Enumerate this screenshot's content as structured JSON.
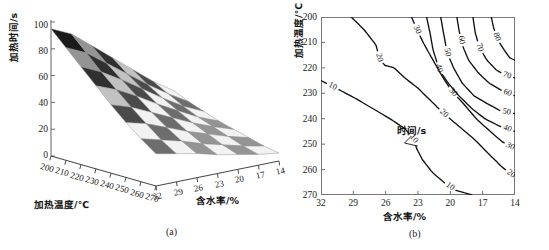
{
  "figure": {
    "panels": [
      {
        "id": "a",
        "caption": "(a)",
        "type": "surface3d",
        "xlabel": "加热温度/℃",
        "ylabel": "含水率/%",
        "zlabel": "加热时间/s",
        "xticks": [
          "200",
          "210",
          "220",
          "230",
          "240",
          "250",
          "260",
          "270"
        ],
        "yticks": [
          "32",
          "29",
          "26",
          "23",
          "20",
          "17",
          "14"
        ],
        "zticks": [
          "0",
          "20",
          "40",
          "60",
          "80",
          "100"
        ]
      },
      {
        "id": "b",
        "caption": "(b)",
        "type": "contour",
        "xlabel": "含水率/%",
        "ylabel": "加热温度/℃",
        "xticks": [
          "32",
          "29",
          "26",
          "23",
          "20",
          "17",
          "14"
        ],
        "yticks": [
          "200",
          "210",
          "220",
          "230",
          "240",
          "250",
          "260",
          "270"
        ],
        "annotation": "时间/s",
        "contour_levels": [
          "10",
          "20",
          "30",
          "40",
          "50",
          "60",
          "70",
          "80"
        ]
      }
    ]
  },
  "chart_data": [
    {
      "type": "area",
      "subtype": "surface3d-mesh",
      "title": "",
      "panel": "(a)",
      "xlabel": "加热温度/℃",
      "ylabel": "含水率/%",
      "zlabel": "加热时间/s",
      "xlim": [
        200,
        270
      ],
      "ylim": [
        32,
        14
      ],
      "zlim": [
        0,
        100
      ],
      "grid": false,
      "legend": "none",
      "x": [
        200,
        210,
        220,
        230,
        240,
        250,
        260,
        270
      ],
      "y": [
        32,
        29,
        26,
        23,
        20,
        17,
        14
      ],
      "z_note": "heating time (s) as function of heating temperature (x) and moisture content (y); falls with rising temperature and with falling moisture content",
      "z": [
        [
          95,
          88,
          76,
          64,
          52,
          40,
          30
        ],
        [
          84,
          77,
          66,
          55,
          44,
          34,
          25
        ],
        [
          73,
          66,
          57,
          47,
          37,
          28,
          21
        ],
        [
          62,
          56,
          48,
          39,
          31,
          23,
          17
        ],
        [
          51,
          46,
          39,
          32,
          25,
          19,
          14
        ],
        [
          41,
          37,
          31,
          25,
          20,
          15,
          11
        ],
        [
          32,
          28,
          24,
          19,
          15,
          11,
          8
        ],
        [
          24,
          21,
          18,
          14,
          11,
          8,
          6
        ]
      ]
    },
    {
      "type": "line",
      "subtype": "contour",
      "title": "",
      "panel": "(b)",
      "xlabel": "含水率/%",
      "ylabel": "加热温度/℃",
      "xlim": [
        32,
        14
      ],
      "ylim": [
        200,
        270
      ],
      "yaxis_inverted": true,
      "grid": false,
      "legend": "none",
      "annotations": [
        {
          "text": "时间/s",
          "x": 23.6,
          "y": 246,
          "points_to_contour": "10"
        }
      ],
      "levels": [
        10,
        20,
        30,
        40,
        50,
        60,
        70,
        80
      ],
      "contours": [
        {
          "level": "10",
          "label_positions": [
            {
              "x": 31.0,
              "y": 228
            },
            {
              "x": 23.4,
              "y": 248
            },
            {
              "x": 20.4,
              "y": 269
            }
          ],
          "path": [
            [
              32,
              225
            ],
            [
              30.6,
              228
            ],
            [
              28.8,
              232
            ],
            [
              27.2,
              236
            ],
            [
              25.6,
              240
            ],
            [
              24.2,
              244
            ],
            [
              23.4,
              248
            ],
            [
              23.1,
              252
            ],
            [
              22.6,
              256
            ],
            [
              21.7,
              261
            ],
            [
              20.6,
              265
            ],
            [
              19.6,
              268
            ],
            [
              18.0,
              270
            ]
          ]
        },
        {
          "level": "20",
          "label_positions": [
            {
              "x": 26.6,
              "y": 216
            },
            {
              "x": 20.6,
              "y": 238
            },
            {
              "x": 14.6,
              "y": 263
            }
          ],
          "path": [
            [
              29.2,
              200
            ],
            [
              28.0,
              205
            ],
            [
              26.9,
              211
            ],
            [
              26.6,
              216
            ],
            [
              26.1,
              219
            ],
            [
              25.2,
              220
            ],
            [
              24.2,
              224
            ],
            [
              23.0,
              228
            ],
            [
              21.8,
              233
            ],
            [
              20.6,
              238
            ],
            [
              19.2,
              243
            ],
            [
              17.8,
              248
            ],
            [
              16.4,
              254
            ],
            [
              15.2,
              259
            ],
            [
              14,
              263
            ]
          ]
        },
        {
          "level": "30",
          "label_positions": [
            {
              "x": 23.1,
              "y": 205
            },
            {
              "x": 19.6,
              "y": 229
            },
            {
              "x": 14.6,
              "y": 252
            }
          ],
          "path": [
            [
              23.6,
              200
            ],
            [
              23.1,
              205
            ],
            [
              22.4,
              211
            ],
            [
              21.6,
              217
            ],
            [
              20.8,
              223
            ],
            [
              19.9,
              229
            ],
            [
              18.8,
              234
            ],
            [
              17.6,
              240
            ],
            [
              16.3,
              245
            ],
            [
              15.2,
              249
            ],
            [
              14,
              252
            ]
          ]
        },
        {
          "level": "40",
          "label_positions": [
            {
              "x": 21.6,
              "y": 221
            },
            {
              "x": 14.8,
              "y": 245
            }
          ],
          "path": [
            [
              22.2,
              200
            ],
            [
              21.9,
              206
            ],
            [
              21.6,
              213
            ],
            [
              21.0,
              221
            ],
            [
              20.2,
              226
            ],
            [
              19.2,
              231
            ],
            [
              18.0,
              236
            ],
            [
              16.8,
              240
            ],
            [
              15.4,
              243
            ],
            [
              14,
              245
            ]
          ]
        },
        {
          "level": "50",
          "label_positions": [
            {
              "x": 20.4,
              "y": 214
            },
            {
              "x": 14.8,
              "y": 238
            }
          ],
          "path": [
            [
              20.9,
              200
            ],
            [
              20.6,
              207
            ],
            [
              20.3,
              214
            ],
            [
              19.7,
              220
            ],
            [
              18.9,
              226
            ],
            [
              17.8,
              231
            ],
            [
              16.6,
              234
            ],
            [
              15.3,
              237
            ],
            [
              14,
              238
            ]
          ]
        },
        {
          "level": "60",
          "label_positions": [
            {
              "x": 18.9,
              "y": 209
            },
            {
              "x": 14.8,
              "y": 231
            }
          ],
          "path": [
            [
              19.4,
              200
            ],
            [
              19.2,
              205
            ],
            [
              18.9,
              211
            ],
            [
              18.3,
              217
            ],
            [
              17.4,
              222
            ],
            [
              16.4,
              226
            ],
            [
              15.2,
              229
            ],
            [
              14,
              231
            ]
          ]
        },
        {
          "level": "70",
          "label_positions": [
            {
              "x": 17.3,
              "y": 212
            },
            {
              "x": 14.8,
              "y": 224
            }
          ],
          "path": [
            [
              17.9,
              200
            ],
            [
              17.7,
              206
            ],
            [
              17.3,
              212
            ],
            [
              16.6,
              217
            ],
            [
              15.7,
              221
            ],
            [
              14.8,
              223
            ],
            [
              14,
              224
            ]
          ]
        },
        {
          "level": "80",
          "label_positions": [
            {
              "x": 15.8,
              "y": 208
            }
          ],
          "path": [
            [
              16.2,
              200
            ],
            [
              16.0,
              204
            ],
            [
              15.6,
              209
            ],
            [
              15.0,
              213
            ],
            [
              14.5,
              216
            ],
            [
              14,
              217
            ]
          ]
        }
      ]
    }
  ]
}
